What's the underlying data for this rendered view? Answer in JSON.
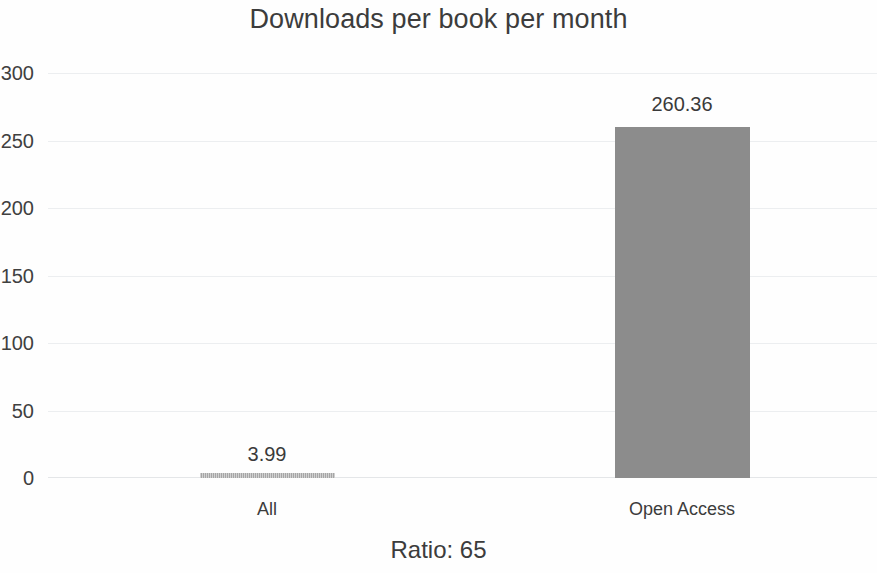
{
  "chart_data": {
    "type": "bar",
    "title": "Downloads per book per month",
    "categories": [
      "All",
      "Open Access"
    ],
    "values": [
      3.99,
      260.36
    ],
    "data_labels": [
      "3.99",
      "260.36"
    ],
    "xlabel": "",
    "ylabel": "",
    "ylim": [
      0,
      300
    ],
    "yticks": [
      300,
      250,
      200,
      150,
      100,
      50,
      0
    ],
    "ytick_labels": [
      "300",
      "250",
      "200",
      "150",
      "100",
      "50",
      "0"
    ],
    "grid": true,
    "legend": false,
    "series": [
      {
        "name": "Downloads per book per month",
        "values": [
          3.99,
          260.36
        ],
        "color": "#8c8c8c"
      }
    ],
    "annotations": [
      "Ratio: 65"
    ],
    "caption": "Ratio: 65"
  },
  "colors": {
    "bar": "#8c8c8c",
    "grid": "#eceef0",
    "text": "#3c3c3c",
    "background": "#fefefe"
  }
}
